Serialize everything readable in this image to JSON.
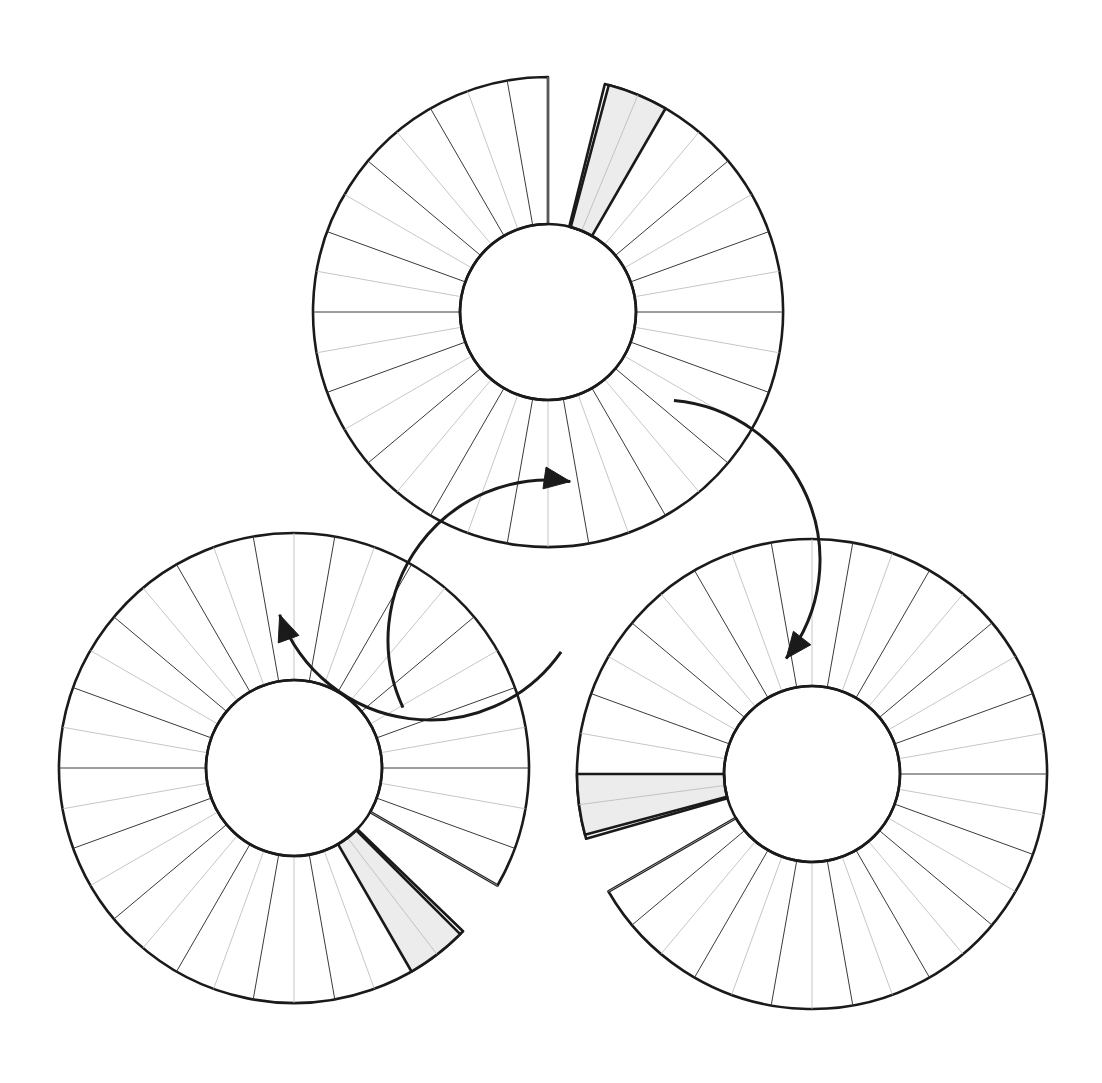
{
  "canvas": {
    "width": 1102,
    "height": 1083,
    "background": "#ffffff"
  },
  "diagram": {
    "title": "Three-wheel rotational transfer diagram"
  },
  "style": {
    "outline_color": "#1a1a1a",
    "outline_width": 2.6,
    "spoke_dark_color": "#3a3a3a",
    "spoke_dark_width": 1.0,
    "spoke_light_color": "#b8b8b8",
    "spoke_light_width": 0.8,
    "shaded_sector_fill": "#ececec",
    "shaded_sector_stroke": "#1a1a1a",
    "shaded_sector_stroke_width": 2.6,
    "arrow_color": "#1a1a1a",
    "arrow_width": 3.0
  },
  "wheel_geometry": {
    "outer_radius": 235,
    "inner_radius": 88,
    "sector_count": 36,
    "sector_angle_deg": 10,
    "gap_angle_deg": 14,
    "shaded_angle_deg": 15
  },
  "wheels": [
    {
      "id": "wheel-top",
      "label": "Top wheel",
      "cx": 548,
      "cy": 312,
      "gap_start_deg": 76,
      "gap_end_deg": 90,
      "shaded_start_deg": 60,
      "shaded_end_deg": 75,
      "rotation_offset_deg": 0
    },
    {
      "id": "wheel-left",
      "label": "Lower-left wheel",
      "cx": 294,
      "cy": 768,
      "gap_start_deg": -44,
      "gap_end_deg": -30,
      "shaded_start_deg": -60,
      "shaded_end_deg": -45,
      "rotation_offset_deg": 0
    },
    {
      "id": "wheel-right",
      "label": "Lower-right wheel",
      "cx": 812,
      "cy": 774,
      "gap_start_deg": 196,
      "gap_end_deg": 210,
      "shaded_start_deg": 180,
      "shaded_end_deg": 195,
      "rotation_offset_deg": 0
    }
  ],
  "arrows": [
    {
      "id": "arrow-left-to-top",
      "label": "Rotation arrow pointing to top wheel",
      "center_x": 548,
      "center_y": 640,
      "radius": 160,
      "start_deg": 205,
      "end_deg": 82,
      "direction": "clockwise"
    },
    {
      "id": "arrow-top-to-right",
      "label": "Rotation arrow pointing to lower-right wheel",
      "center_x": 660,
      "center_y": 560,
      "radius": 160,
      "start_deg": 85,
      "end_deg": -38,
      "direction": "clockwise"
    },
    {
      "id": "arrow-right-to-left",
      "label": "Rotation arrow pointing to lower-left wheel",
      "center_x": 430,
      "center_y": 560,
      "radius": 160,
      "start_deg": -35,
      "end_deg": -160,
      "direction": "clockwise"
    }
  ]
}
